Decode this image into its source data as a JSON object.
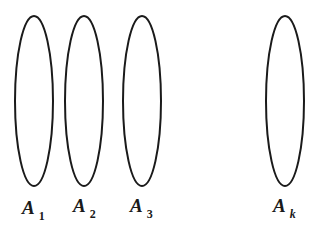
{
  "diagram": {
    "stroke_color": "#1a1a1a",
    "background": "#ffffff",
    "sets": [
      {
        "name": "A",
        "subscript": "1",
        "cx": 34,
        "cy": 101,
        "rx": 19,
        "ry": 85
      },
      {
        "name": "A",
        "subscript": "2",
        "cx": 84,
        "cy": 101,
        "rx": 19,
        "ry": 85
      },
      {
        "name": "A",
        "subscript": "3",
        "cx": 142,
        "cy": 101,
        "rx": 19,
        "ry": 85
      },
      {
        "name": "A",
        "subscript": "k",
        "cx": 285,
        "cy": 101,
        "rx": 19,
        "ry": 85
      }
    ]
  }
}
